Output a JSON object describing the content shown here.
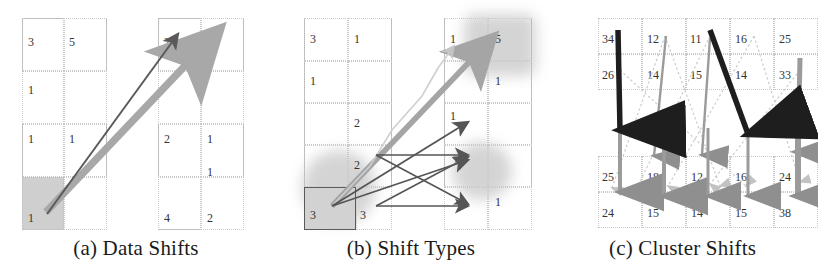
{
  "figure": {
    "type": "multi-panel-diagram",
    "panel_count": 3
  },
  "panels": [
    {
      "id": "a",
      "caption": "(a) Data Shifts",
      "left_grid": {
        "columns": 2,
        "rows": 4,
        "cells": [
          {
            "r": 0,
            "c": 0,
            "value": "3"
          },
          {
            "r": 0,
            "c": 1,
            "value": "5"
          },
          {
            "r": 1,
            "c": 0,
            "value": "1"
          },
          {
            "r": 1,
            "c": 1,
            "value": ""
          },
          {
            "r": 2,
            "c": 0,
            "value": "1"
          },
          {
            "r": 2,
            "c": 1,
            "value": "1"
          },
          {
            "r": 3,
            "c": 0,
            "value": "1",
            "shaded": true
          },
          {
            "r": 3,
            "c": 1,
            "value": ""
          }
        ]
      },
      "right_grid": {
        "columns": 2,
        "rows": 4,
        "cells": [
          {
            "r": 0,
            "c": 0,
            "value": "2"
          },
          {
            "r": 0,
            "c": 1,
            "value": "3"
          },
          {
            "r": 1,
            "c": 0,
            "value": "2"
          },
          {
            "r": 1,
            "c": 1,
            "value": "1"
          },
          {
            "r": 2,
            "c": 0,
            "value": ""
          },
          {
            "r": 2,
            "c": 1,
            "value": "1"
          },
          {
            "r": 3,
            "c": 0,
            "value": "4"
          },
          {
            "r": 3,
            "c": 1,
            "value": "2"
          }
        ]
      },
      "arrows": [
        {
          "name": "dark-shift-arrow",
          "style": "thin-dark",
          "from": "bottom-left-shaded-cell",
          "to": "top-right-cell-2"
        },
        {
          "name": "gray-shift-arrow",
          "style": "thick-gray",
          "from": "bottom-left-shaded-cell",
          "to": "top-right-cell-3"
        }
      ]
    },
    {
      "id": "b",
      "caption": "(b) Shift Types",
      "left_grid": {
        "columns": 2,
        "rows": 5,
        "cells": [
          {
            "r": 0,
            "c": 0,
            "value": "3"
          },
          {
            "r": 0,
            "c": 1,
            "value": "1"
          },
          {
            "r": 1,
            "c": 0,
            "value": "1"
          },
          {
            "r": 1,
            "c": 1,
            "value": ""
          },
          {
            "r": 2,
            "c": 0,
            "value": ""
          },
          {
            "r": 2,
            "c": 1,
            "value": "2"
          },
          {
            "r": 3,
            "c": 0,
            "value": ""
          },
          {
            "r": 3,
            "c": 1,
            "value": "2"
          },
          {
            "r": 4,
            "c": 0,
            "value": "3",
            "boxed": true
          },
          {
            "r": 4,
            "c": 1,
            "value": "3"
          }
        ]
      },
      "right_grid": {
        "columns": 2,
        "rows": 5,
        "cells": [
          {
            "r": 0,
            "c": 0,
            "value": "1"
          },
          {
            "r": 0,
            "c": 1,
            "value": "5"
          },
          {
            "r": 1,
            "c": 0,
            "value": ""
          },
          {
            "r": 1,
            "c": 1,
            "value": "1"
          },
          {
            "r": 2,
            "c": 0,
            "value": "1"
          },
          {
            "r": 2,
            "c": 1,
            "value": ""
          },
          {
            "r": 3,
            "c": 0,
            "value": ""
          },
          {
            "r": 3,
            "c": 1,
            "value": ""
          },
          {
            "r": 4,
            "c": 0,
            "value": ""
          },
          {
            "r": 4,
            "c": 1,
            "value": "1"
          }
        ]
      },
      "arrows": [
        {
          "name": "long-gray-shift-arrow",
          "style": "thick-gray",
          "to": "top-right-cluster"
        },
        {
          "name": "dark-shift-arrow-up",
          "style": "thin-dark",
          "to": "upper-right-cell"
        },
        {
          "name": "dark-shift-arrow-mid",
          "style": "thin-dark",
          "to": "middle-right-blob"
        },
        {
          "name": "dark-shift-arrow-low",
          "style": "thin-dark",
          "to": "lower-right-cell"
        },
        {
          "name": "dark-crossing-arrow-a",
          "style": "thin-dark",
          "to": "middle-right-blob"
        },
        {
          "name": "dark-crossing-arrow-b",
          "style": "thin-dark",
          "to": "lower-right-cell"
        }
      ],
      "highlights": [
        {
          "name": "source-blob",
          "shape": "circle"
        },
        {
          "name": "target-blob-top",
          "shape": "rect"
        },
        {
          "name": "target-blob-mid",
          "shape": "circle"
        }
      ]
    },
    {
      "id": "c",
      "caption": "(c) Cluster Shifts",
      "top_clusters": [
        {
          "name": "cluster-top-left",
          "rows": [
            [
              "34",
              "12"
            ],
            [
              "26",
              "14"
            ]
          ]
        },
        {
          "name": "cluster-top-right",
          "rows": [
            [
              "11",
              "16",
              "25"
            ],
            [
              "15",
              "14",
              "33"
            ]
          ]
        }
      ],
      "bottom_clusters": [
        {
          "name": "cluster-bottom-left",
          "rows": [
            [
              "25",
              "18",
              "12"
            ],
            [
              "24",
              "15",
              "14"
            ]
          ]
        },
        {
          "name": "cluster-bottom-right",
          "rows": [
            [
              "16",
              "24"
            ],
            [
              "15",
              "38"
            ]
          ]
        }
      ],
      "arrows": [
        {
          "name": "thick-black-cluster-arrow-1",
          "style": "thick-black"
        },
        {
          "name": "thick-black-cluster-arrow-2",
          "style": "thick-black"
        },
        {
          "name": "gray-cluster-arrow-1",
          "style": "gray"
        },
        {
          "name": "gray-cluster-arrow-2",
          "style": "gray"
        },
        {
          "name": "gray-cluster-arrow-3",
          "style": "gray"
        },
        {
          "name": "gray-cluster-arrow-4",
          "style": "gray"
        },
        {
          "name": "gray-cluster-arrow-5",
          "style": "gray"
        },
        {
          "name": "faint-dotted-arrow-1",
          "style": "faint-dotted"
        },
        {
          "name": "faint-dotted-arrow-2",
          "style": "faint-dotted"
        },
        {
          "name": "faint-dotted-arrow-3",
          "style": "faint-dotted"
        },
        {
          "name": "faint-dotted-arrow-4",
          "style": "faint-dotted"
        },
        {
          "name": "faint-dotted-arrow-5",
          "style": "faint-dotted"
        },
        {
          "name": "faint-dotted-arrow-6",
          "style": "faint-dotted"
        }
      ]
    }
  ],
  "colors": {
    "dark_arrow": "#555555",
    "gray_arrow": "#9a9a9a",
    "black_arrow": "#1e1e1e",
    "grid_line": "#c9c9c9",
    "shaded_cell": "#cfcfcf",
    "text": "#333333"
  }
}
